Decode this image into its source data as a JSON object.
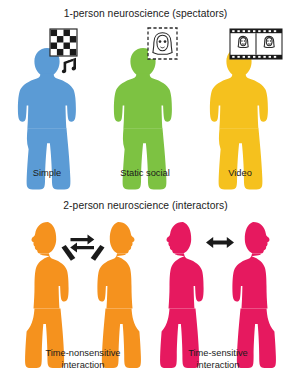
{
  "figure": {
    "background_color": "#ffffff",
    "width": 291,
    "height": 384
  },
  "panels": [
    {
      "id": "one-person",
      "title": "1-person neuroscience (spectators)",
      "people": [
        {
          "label": "Simple",
          "color": "#5B9BD5",
          "stimulus_icon": "checkerboard-icon",
          "extra_icon": "music-notes-icon"
        },
        {
          "label": "Static social",
          "color": "#7DC242",
          "stimulus_icon": "static-face-photo-icon",
          "extra_icon": null
        },
        {
          "label": "Video",
          "color": "#F5C11E",
          "stimulus_icon": "film-strip-faces-icon",
          "extra_icon": null
        }
      ]
    },
    {
      "id": "two-person",
      "title": "2-person neuroscience (interactors)",
      "dyads": [
        {
          "label_line1": "Time-nonsensitive",
          "label_line2": "interaction",
          "color": "#F5921E",
          "arrow_icon": "turn-taking-arrows-icon",
          "gesture": "pointing-hands"
        },
        {
          "label_line1": "Time-sensitive",
          "label_line2": "interaction",
          "color": "#E6195F",
          "arrow_icon": "bidirectional-arrow-icon",
          "gesture": "none"
        }
      ]
    }
  ],
  "colors": {
    "blue": "#5B9BD5",
    "green": "#7DC242",
    "yellow": "#F5C11E",
    "orange": "#F5921E",
    "pink": "#E6195F",
    "ink": "#1b1b1b",
    "icon_stroke": "#2b2b2b"
  }
}
